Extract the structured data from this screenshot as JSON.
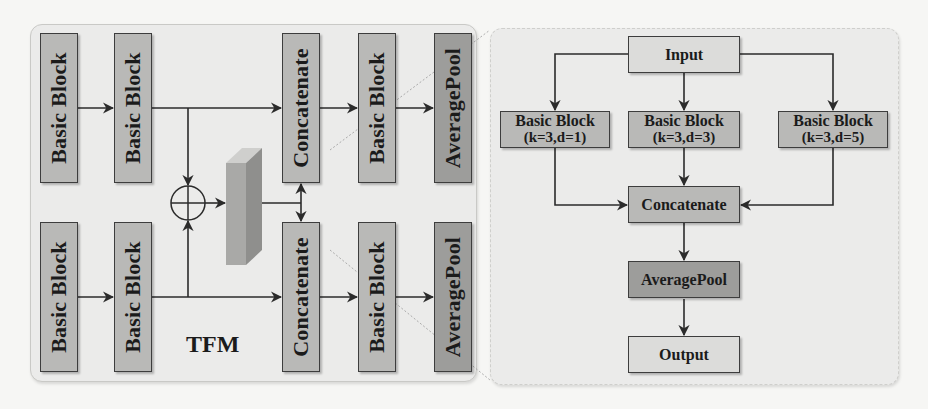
{
  "left_module": {
    "label": "TFM",
    "top_row": [
      {
        "label": "Basic Block"
      },
      {
        "label": "Basic Block"
      },
      {
        "label": "Concatenate"
      },
      {
        "label": "Basic Block"
      },
      {
        "label": "AveragePool"
      }
    ],
    "bottom_row": [
      {
        "label": "Basic Block"
      },
      {
        "label": "Basic Block"
      },
      {
        "label": "Concatenate"
      },
      {
        "label": "Basic Block"
      },
      {
        "label": "AveragePool"
      }
    ],
    "fusion_op": "element-wise-add",
    "feature_map": "3d-feature-block"
  },
  "right_module": {
    "input": {
      "label": "Input"
    },
    "branches": [
      {
        "label": "Basic Block",
        "params": "(k=3,d=1)"
      },
      {
        "label": "Basic Block",
        "params": "(k=3,d=3)"
      },
      {
        "label": "Basic Block",
        "params": "(k=3,d=5)"
      }
    ],
    "concat": {
      "label": "Concatenate"
    },
    "pool": {
      "label": "AveragePool"
    },
    "output": {
      "label": "Output"
    }
  },
  "colors": {
    "block_fill": "#b9b9b7",
    "block_fill_dark": "#9d9d9b",
    "block_fill_light": "#dcdcda",
    "panel_fill": "#ebebea",
    "stroke": "#2b2b2b"
  }
}
